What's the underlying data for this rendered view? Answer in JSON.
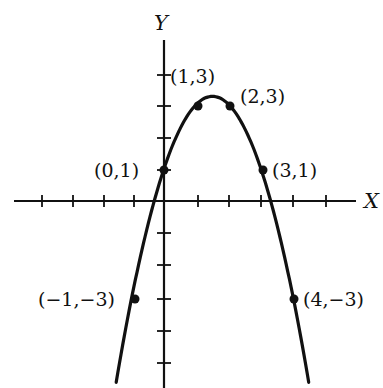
{
  "chart_data": {
    "type": "line",
    "title": "",
    "xlabel": "X",
    "ylabel": "Y",
    "function": "y = -x^2 + 3x + 1",
    "xlim": [
      -4,
      5
    ],
    "ylim": [
      -5,
      4
    ],
    "grid": false,
    "x_tick_step": 1,
    "y_tick_step": 1,
    "series": [
      {
        "name": "parabola",
        "points": [
          {
            "x": -1,
            "y": -3,
            "label": "(−1,−3)"
          },
          {
            "x": 0,
            "y": 1,
            "label": "(0,1)"
          },
          {
            "x": 1,
            "y": 3,
            "label": "(1,3)"
          },
          {
            "x": 2,
            "y": 3,
            "label": "(2,3)"
          },
          {
            "x": 3,
            "y": 1,
            "label": "(3,1)"
          },
          {
            "x": 4,
            "y": -3,
            "label": "(4,−3)"
          }
        ]
      }
    ]
  },
  "labels": {
    "x_axis": "X",
    "y_axis": "Y",
    "p_m1_m3": "(−1,−3)",
    "p_0_1": "(0,1)",
    "p_1_3": "(1,3)",
    "p_2_3": "(2,3)",
    "p_3_1": "(3,1)",
    "p_4_m3": "(4,−3)"
  },
  "colors": {
    "ink": "#111111",
    "background": "#ffffff"
  }
}
